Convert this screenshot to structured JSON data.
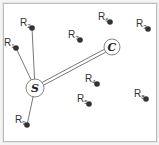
{
  "diagram": {
    "source": {
      "label": "S",
      "x": 35,
      "y": 88,
      "r": 9
    },
    "controller": {
      "label": "C",
      "x": 112,
      "y": 47,
      "r": 8
    },
    "nodes": [
      {
        "id": "R1",
        "base": "R",
        "sub": "1",
        "x": 16,
        "y": 48,
        "connected_to_source": true
      },
      {
        "id": "R2",
        "base": "R",
        "sub": "2",
        "x": 32,
        "y": 28,
        "connected_to_source": true
      },
      {
        "id": "R3",
        "base": "R",
        "sub": "3",
        "x": 148,
        "y": 29,
        "connected_to_source": false
      },
      {
        "id": "R4",
        "base": "R",
        "sub": "4",
        "x": 97,
        "y": 84,
        "connected_to_source": false
      },
      {
        "id": "R5",
        "base": "R",
        "sub": "5",
        "x": 89,
        "y": 104,
        "connected_to_source": false
      },
      {
        "id": "R6",
        "base": "R",
        "sub": "6",
        "x": 110,
        "y": 22,
        "connected_to_source": false
      },
      {
        "id": "R7",
        "base": "R",
        "sub": "7",
        "x": 80,
        "y": 40,
        "connected_to_source": false
      },
      {
        "id": "R8",
        "base": "R",
        "sub": "8",
        "x": 146,
        "y": 99,
        "connected_to_source": false
      },
      {
        "id": "R9",
        "base": "R",
        "sub": "9",
        "x": 27,
        "y": 125,
        "connected_to_source": true
      }
    ],
    "link_style": {
      "source_controller": "double-line",
      "node_links": "single-line"
    },
    "colors": {
      "node": "#333333",
      "line": "#555555",
      "frame": "#bdbdbd"
    }
  }
}
